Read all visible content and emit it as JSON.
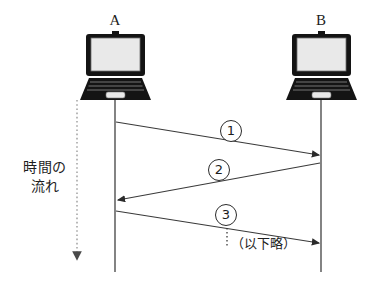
{
  "diagram": {
    "type": "sequence-diagram",
    "nodes": [
      {
        "id": "a",
        "label": "A",
        "icon": "laptop-icon",
        "x": 115
      },
      {
        "id": "b",
        "label": "B",
        "icon": "laptop-icon",
        "x": 321
      }
    ],
    "time_axis": {
      "caption_line1": "時間の",
      "caption_line2": "流れ",
      "direction": "downward",
      "style": "dotted-arrow"
    },
    "messages": [
      {
        "number": "①",
        "from": "A",
        "to": "B"
      },
      {
        "number": "②",
        "from": "B",
        "to": "A"
      },
      {
        "number": "③",
        "from": "A",
        "to": "B"
      }
    ],
    "continuation_note": "（以下略）",
    "colors": {
      "stroke": "#2b2b2b",
      "laptop_body": "#141414",
      "screen_fill": "#e8e8e8",
      "background": "#ffffff"
    }
  }
}
